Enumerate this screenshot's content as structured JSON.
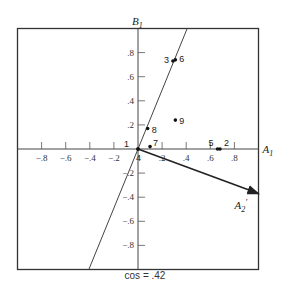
{
  "chart_data": {
    "type": "scatter",
    "title": "",
    "caption": "cos = .42",
    "xlabel": "A1",
    "ylabel": "B1",
    "xlim": [
      -1.0,
      1.0
    ],
    "ylim": [
      -1.0,
      1.0
    ],
    "grid": false,
    "x_ticks": [
      -0.8,
      -0.6,
      -0.4,
      -0.2,
      0.2,
      0.4,
      0.6,
      0.8
    ],
    "x_tick_labels": [
      "−.8",
      "−.6",
      "−.4",
      "−.2",
      ".2",
      ".4",
      ".6",
      ".8"
    ],
    "y_ticks": [
      0.8,
      0.6,
      0.4,
      0.2,
      -0.2,
      -0.4,
      -0.6,
      -0.8
    ],
    "y_tick_labels": [
      ".8",
      ".6",
      ".4",
      ".2",
      "−.2",
      "−.4",
      "−.6",
      "−.8"
    ],
    "points": [
      {
        "label": "1",
        "x": 0.0,
        "y": 0.0
      },
      {
        "label": "2",
        "x": 0.68,
        "y": 0.0
      },
      {
        "label": "3",
        "x": 0.29,
        "y": 0.73
      },
      {
        "label": "4",
        "x": 0.0,
        "y": 0.0
      },
      {
        "label": "5",
        "x": 0.66,
        "y": 0.0
      },
      {
        "label": "6",
        "x": 0.31,
        "y": 0.74
      },
      {
        "label": "7",
        "x": 0.1,
        "y": 0.02
      },
      {
        "label": "8",
        "x": 0.08,
        "y": 0.17
      },
      {
        "label": "9",
        "x": 0.31,
        "y": 0.24
      }
    ],
    "reference_line": {
      "through_origin": true,
      "slope": 2.45,
      "description": "line through origin and points 3, 6, 8"
    },
    "vector": {
      "label": "A2′",
      "from": [
        0,
        0
      ],
      "to": [
        1.0,
        -0.37
      ]
    }
  },
  "labels": {
    "x_axis": "A",
    "x_axis_sub": "1",
    "y_axis": "B",
    "y_axis_sub": "1",
    "vector": "A",
    "vector_sub": "2",
    "vector_prime": "′",
    "caption": "cos = .42"
  }
}
